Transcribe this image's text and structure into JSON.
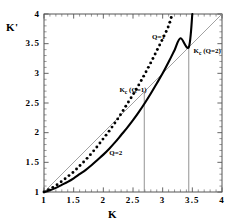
{
  "figure": {
    "background": "#ffffff",
    "frame_color": "#555555",
    "plot_box_px": {
      "left": 44,
      "top": 14,
      "right": 222,
      "bottom": 192
    }
  },
  "chart_data": {
    "type": "line",
    "title": "",
    "xlabel": "K",
    "ylabel": "K'",
    "xlim": [
      1,
      4
    ],
    "ylim": [
      1,
      4
    ],
    "xticks": [
      "1",
      "1.5",
      "2",
      "2.5",
      "3",
      "3.5",
      "4"
    ],
    "yticks": [
      "1",
      "1.5",
      "2",
      "2.5",
      "3",
      "3.5",
      "4"
    ],
    "xtick_values": [
      1,
      1.5,
      2,
      2.5,
      3,
      3.5,
      4
    ],
    "ytick_values": [
      1,
      1.5,
      2,
      2.5,
      3,
      3.5,
      4
    ],
    "minor_ticks": true,
    "grid": false,
    "legend_position": "inline-annotations",
    "series": [
      {
        "name": "Q=1",
        "style": "dotted",
        "color": "#000000",
        "label": "Q=1",
        "points": [
          [
            1.0,
            1.0
          ],
          [
            1.1,
            1.05
          ],
          [
            1.2,
            1.11
          ],
          [
            1.3,
            1.18
          ],
          [
            1.4,
            1.26
          ],
          [
            1.5,
            1.34
          ],
          [
            1.6,
            1.44
          ],
          [
            1.7,
            1.54
          ],
          [
            1.8,
            1.65
          ],
          [
            1.9,
            1.77
          ],
          [
            2.0,
            1.9
          ],
          [
            2.1,
            2.03
          ],
          [
            2.2,
            2.17
          ],
          [
            2.3,
            2.32
          ],
          [
            2.4,
            2.48
          ],
          [
            2.5,
            2.64
          ],
          [
            2.6,
            2.81
          ],
          [
            2.7,
            2.99
          ],
          [
            2.8,
            3.18
          ],
          [
            2.9,
            3.38
          ],
          [
            3.0,
            3.58
          ],
          [
            3.1,
            3.8
          ],
          [
            3.16,
            4.0
          ]
        ]
      },
      {
        "name": "Q=2",
        "style": "solid",
        "color": "#000000",
        "label": "Q=2",
        "points": [
          [
            1.0,
            1.0
          ],
          [
            1.1,
            1.03
          ],
          [
            1.2,
            1.07
          ],
          [
            1.3,
            1.12
          ],
          [
            1.4,
            1.17
          ],
          [
            1.5,
            1.23
          ],
          [
            1.6,
            1.3
          ],
          [
            1.7,
            1.37
          ],
          [
            1.8,
            1.45
          ],
          [
            1.9,
            1.54
          ],
          [
            2.0,
            1.63
          ],
          [
            2.1,
            1.73
          ],
          [
            2.2,
            1.84
          ],
          [
            2.3,
            1.96
          ],
          [
            2.4,
            2.08
          ],
          [
            2.5,
            2.21
          ],
          [
            2.6,
            2.35
          ],
          [
            2.7,
            2.5
          ],
          [
            2.8,
            2.66
          ],
          [
            2.9,
            2.83
          ],
          [
            3.0,
            3.0
          ],
          [
            3.1,
            3.19
          ],
          [
            3.2,
            3.39
          ],
          [
            3.3,
            3.59
          ],
          [
            3.44,
            3.44
          ],
          [
            3.4,
            3.81
          ],
          [
            3.5,
            4.0
          ]
        ]
      },
      {
        "name": "identity",
        "style": "thin-solid",
        "color": "#8a8a8a",
        "label": "",
        "points": [
          [
            1.0,
            1.0
          ],
          [
            4.0,
            4.0
          ]
        ]
      }
    ],
    "annotations": [
      {
        "text": "Q=1",
        "x": 2.82,
        "y": 3.62,
        "name": "curve-label-q1"
      },
      {
        "text": "Q=2",
        "x": 2.1,
        "y": 1.66,
        "name": "curve-label-q2"
      },
      {
        "text": "K_c (Q=1)",
        "x": 2.27,
        "y": 2.72,
        "name": "kc-q1-label"
      },
      {
        "text": "K_c (Q=2)",
        "x": 3.52,
        "y": 3.38,
        "name": "kc-q2-label"
      }
    ],
    "markers": [
      {
        "name": "kc-q1-dropline",
        "x": 2.69,
        "y_from": 1.0,
        "y_to": 2.69
      },
      {
        "name": "kc-q2-dropline",
        "x": 3.44,
        "y_from": 1.0,
        "y_to": 3.44
      }
    ],
    "critical_points": {
      "kc_q1": 2.69,
      "kc_q2": 3.44
    }
  },
  "labels": {
    "y_axis": "K'",
    "x_axis": "K",
    "kc_q1_main": "K",
    "kc_q1_sub": "c",
    "kc_q1_tail": " (Q=1)",
    "kc_q2_main": "K",
    "kc_q2_sub": "c",
    "kc_q2_tail": " (Q=2)",
    "q1": "Q=1",
    "q2": "Q=2"
  }
}
